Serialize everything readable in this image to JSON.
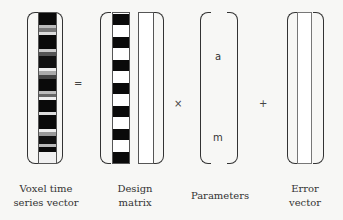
{
  "labels": {
    "voxel": [
      "Voxel time",
      "series vector"
    ],
    "design": [
      "Design",
      "matrix"
    ],
    "params": [
      "Parameters"
    ],
    "error": [
      "Error",
      "vector"
    ]
  },
  "operators": {
    "equals": "=",
    "times": "×",
    "plus": "+"
  },
  "parameters": {
    "first": "a",
    "last": "m"
  },
  "colors": {
    "dark": "#0a0a0a",
    "mid": "#777777",
    "light": "#d8d8d8",
    "white": "#ffffff",
    "line": "#333333"
  }
}
